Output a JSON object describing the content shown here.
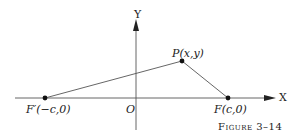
{
  "diagram": {
    "axes": {
      "x_label": "X",
      "y_label": "Y",
      "origin_label": "O"
    },
    "points": [
      {
        "id": "F_prime",
        "label": "F′(−c,0)"
      },
      {
        "id": "P",
        "label": "P(x,y)"
      },
      {
        "id": "F",
        "label": "F(c,0)"
      }
    ],
    "segments": [
      {
        "from": "F_prime",
        "to": "P"
      },
      {
        "from": "P",
        "to": "F"
      }
    ],
    "caption": "Figure 3–14",
    "colors": {
      "line": "#444444",
      "point": "#111111",
      "text": "#222222"
    }
  }
}
